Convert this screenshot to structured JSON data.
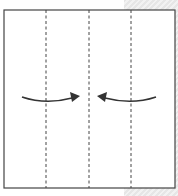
{
  "diagram": {
    "type": "origami-fold-step",
    "colors": {
      "paper": "#ffffff",
      "outline": "#444444",
      "fold_line": "#444444",
      "arrow": "#333333",
      "background_hatch": "#e6e6e6"
    },
    "square": {
      "x": 4,
      "y": 10,
      "width": 171,
      "height": 178
    },
    "fold_lines": [
      {
        "x": 46,
        "style": "dashed"
      },
      {
        "x": 89,
        "style": "dashed"
      },
      {
        "x": 131,
        "style": "dashed"
      }
    ],
    "arrows": [
      {
        "name": "left-edge-fold-arrow",
        "direction": "right",
        "from": [
          22,
          97
        ],
        "to": [
          80,
          96
        ]
      },
      {
        "name": "right-edge-fold-arrow",
        "direction": "left",
        "from": [
          156,
          97
        ],
        "to": [
          97,
          96
        ]
      }
    ]
  }
}
